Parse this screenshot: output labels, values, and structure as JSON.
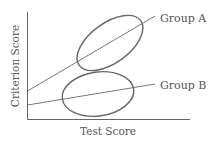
{
  "diagram": {
    "x_axis_label": "Test Score",
    "y_axis_label": "Criterion Score",
    "groups": [
      {
        "name": "Group A",
        "label": "Group A"
      },
      {
        "name": "Group B",
        "label": "Group B"
      }
    ],
    "line_color": "#666666"
  }
}
